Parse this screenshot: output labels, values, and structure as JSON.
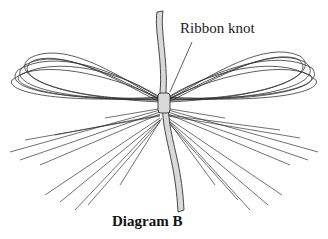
{
  "diagram": {
    "callout_label": "Ribbon knot",
    "caption": "Diagram B",
    "colors": {
      "line": "#333333",
      "ribbon_fill": "#d9d9d9",
      "background": "#ffffff"
    }
  }
}
